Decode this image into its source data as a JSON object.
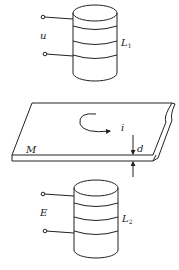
{
  "diagram": {
    "type": "physics-induction-setup",
    "colors": {
      "line": "#222222",
      "background": "#ffffff"
    },
    "top_coil": {
      "voltage_label": "u",
      "coil_label": "L",
      "coil_subscript": "1",
      "turns": 3
    },
    "plate": {
      "label": "M",
      "current_label": "i",
      "thickness_label": "d"
    },
    "bottom_coil": {
      "emf_label": "E",
      "coil_label": "L",
      "coil_subscript": "2",
      "turns": 3
    }
  }
}
